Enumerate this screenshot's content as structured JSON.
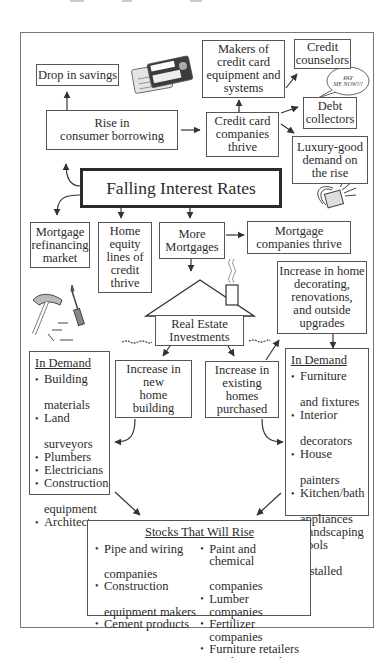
{
  "diagram": {
    "title": "Falling Interest Rates",
    "nodes": {
      "drop_in_savings": "Drop in savings",
      "rise_consumer_borrowing": [
        "Rise in",
        "consumer borrowing"
      ],
      "credit_card_companies": [
        "Credit card",
        "companies",
        "thrive"
      ],
      "makers_credit_card_equipment": [
        "Makers of",
        "credit card",
        "equipment and",
        "systems"
      ],
      "credit_counselors": [
        "Credit",
        "counselors"
      ],
      "debt_collectors": [
        "Debt",
        "collectors"
      ],
      "luxury_good_demand": [
        "Luxury-good",
        "demand on",
        "the rise"
      ],
      "mortgage_refinancing": [
        "Mortgage",
        "refinancing",
        "market"
      ],
      "home_equity": [
        "Home",
        "equity",
        "lines of",
        "credit",
        "thrive"
      ],
      "more_mortgages": [
        "More",
        "Mortgages"
      ],
      "mortgage_companies": [
        "Mortgage",
        "companies thrive"
      ],
      "home_decorating": [
        "Increase in home",
        "decorating,",
        "renovations,",
        "and outside",
        "upgrades"
      ],
      "real_estate": [
        "Real Estate",
        "Investments"
      ],
      "new_home_building": [
        "Increase in",
        "new",
        "home",
        "building"
      ],
      "existing_homes": [
        "Increase in",
        "existing",
        "homes",
        "purchased"
      ]
    },
    "in_demand_left": {
      "heading": "In Demand",
      "items": [
        [
          "Building",
          "materials"
        ],
        [
          "Land",
          "surveyors"
        ],
        [
          "Plumbers"
        ],
        [
          "Electricians"
        ],
        [
          "Construction",
          "equipment"
        ],
        [
          "Architects"
        ]
      ]
    },
    "in_demand_right": {
      "heading": "In Demand",
      "items": [
        [
          "Furniture",
          "and fixtures"
        ],
        [
          "Interior",
          "decorators"
        ],
        [
          "House",
          "painters"
        ],
        [
          "Kitchen/bath",
          "appliances"
        ],
        [
          "Landscaping"
        ],
        [
          "Pools",
          "installed"
        ]
      ]
    },
    "stocks": {
      "heading": "Stocks That Will Rise",
      "left": [
        [
          "Pipe and wiring",
          "companies"
        ],
        [
          "Construction",
          "equipment makers"
        ],
        [
          "Cement products"
        ]
      ],
      "right": [
        [
          "Paint and chemical",
          "companies"
        ],
        [
          "Lumber companies"
        ],
        [
          "Fertilizer companies"
        ],
        [
          "Furniture retailers"
        ],
        [
          "Appliance makers"
        ]
      ]
    },
    "illustrations": {
      "speech_bubble": [
        "PAY",
        "ME NOW!!!"
      ],
      "credit_card_brand": "OmniCredit"
    }
  }
}
